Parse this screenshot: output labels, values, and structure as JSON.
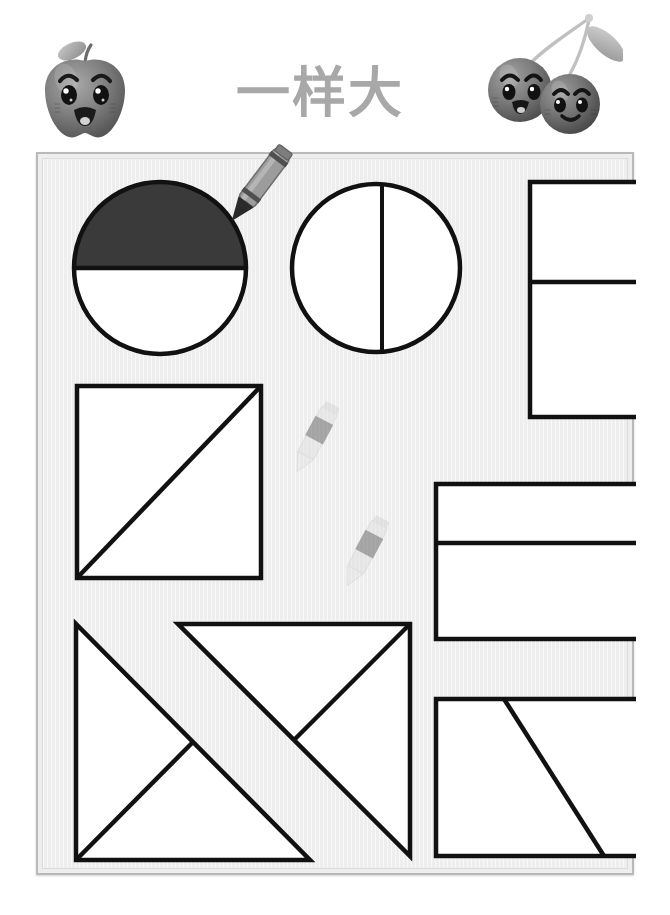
{
  "worksheet": {
    "title": "一样大",
    "title_color": "#a8a8a8",
    "panel_background": "#eeeeee",
    "panel_border_color": "#b9b9b9",
    "stroke_color": "#111111",
    "shaded_fill_color": "#3a3a3a",
    "unshaded_fill_color": "#ffffff"
  },
  "mascots": [
    {
      "name": "apple-mascot",
      "label": "apple",
      "color": "#8c8c8c"
    },
    {
      "name": "cherries-mascot",
      "label": "cherries",
      "color": "#8c8c8c"
    }
  ],
  "decorations": [
    {
      "name": "crayon-pointer",
      "label": "crayon pointing at shaded circle",
      "color": "#9a9a9a"
    },
    {
      "name": "deco-crayon-1",
      "label": "faded crayon",
      "color": "#cccccc"
    },
    {
      "name": "deco-crayon-2",
      "label": "faded crayon",
      "color": "#cccccc"
    }
  ],
  "shapes": [
    {
      "name": "circle-half-shaded",
      "type": "circle",
      "row": 1,
      "column": 1,
      "divisions": 2,
      "division_direction": "horizontal",
      "shaded_parts": 1,
      "fraction": "1/2",
      "label": "circle split in half horizontally, top half shaded"
    },
    {
      "name": "circle-split-vertical",
      "type": "circle",
      "row": 1,
      "column": 2,
      "divisions": 2,
      "division_direction": "vertical",
      "shaded_parts": 0,
      "fraction": "1/2",
      "label": "circle split in half vertically"
    },
    {
      "name": "rectangle-tall-split-horizontal",
      "type": "rectangle",
      "row": 1,
      "column": 3,
      "divisions": 2,
      "division_direction": "horizontal",
      "shaded_parts": 0,
      "fraction": "1/2",
      "label": "tall rectangle split horizontally"
    },
    {
      "name": "square-split-diagonal",
      "type": "square",
      "row": 2,
      "column": 1,
      "divisions": 2,
      "division_direction": "diagonal",
      "shaded_parts": 0,
      "fraction": "1/2",
      "label": "square split by diagonal from bottom-left to top-right"
    },
    {
      "name": "rectangle-wide-split-horizontal",
      "type": "rectangle",
      "row": 2,
      "column": 3,
      "divisions": 2,
      "division_direction": "horizontal",
      "shaded_parts": 0,
      "fraction": "1/2",
      "label": "wide rectangle split horizontally"
    },
    {
      "name": "triangles-crossed-pair",
      "type": "triangle-pair",
      "row": 3,
      "column": 1,
      "divisions": 4,
      "division_direction": "diagonal",
      "shaded_parts": 0,
      "fraction": "1/2",
      "label": "two large right triangles overlapping in an X arrangement, each split again"
    },
    {
      "name": "rectangle-split-slant",
      "type": "rectangle",
      "row": 3,
      "column": 3,
      "divisions": 2,
      "division_direction": "slant",
      "shaded_parts": 0,
      "fraction": "1/2",
      "label": "rectangle split by a slanted line into two trapezoids"
    }
  ]
}
